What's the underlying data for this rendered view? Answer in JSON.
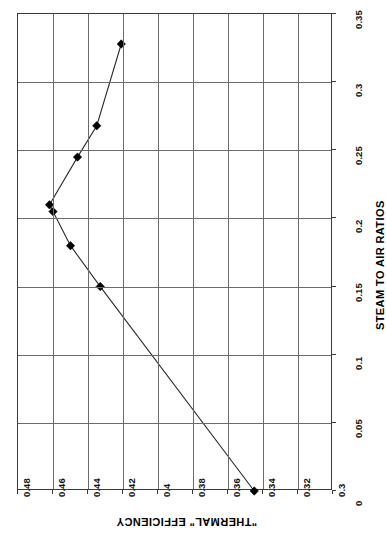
{
  "chart_data": {
    "type": "line",
    "title": "",
    "subtitle": "",
    "orientation": "rotated-90",
    "xlabel": "STEAM TO AIR RATIOS",
    "ylabel": "\"THERMAL\" EFFICIENCY",
    "xlim": [
      0,
      0.35
    ],
    "ylim": [
      0.3,
      0.48
    ],
    "xticks": [
      "0",
      "0.05",
      "0.1",
      "0.15",
      "0.2",
      "0.25",
      "0.3",
      "0.35"
    ],
    "xtick_values": [
      0,
      0.05,
      0.1,
      0.15,
      0.2,
      0.25,
      0.3,
      0.35
    ],
    "yticks": [
      "0.3",
      "0.32",
      "0.34",
      "0.36",
      "0.38",
      "0.4",
      "0.42",
      "0.44",
      "0.46",
      "0.48"
    ],
    "ytick_values": [
      0.3,
      0.32,
      0.34,
      0.36,
      0.38,
      0.4,
      0.42,
      0.44,
      0.46,
      0.48
    ],
    "grid": true,
    "legend": false,
    "legend_position": "none",
    "marker": "diamond",
    "marker_color": "#000000",
    "line_color": "#2b2b2b",
    "x": [
      0,
      0.15,
      0.18,
      0.205,
      0.21,
      0.245,
      0.268,
      0.328
    ],
    "y": [
      0.345,
      0.433,
      0.45,
      0.46,
      0.462,
      0.446,
      0.435,
      0.421
    ],
    "points": [
      {
        "x": 0,
        "y": 0.345
      },
      {
        "x": 0.15,
        "y": 0.433
      },
      {
        "x": 0.18,
        "y": 0.45
      },
      {
        "x": 0.205,
        "y": 0.46
      },
      {
        "x": 0.21,
        "y": 0.462
      },
      {
        "x": 0.245,
        "y": 0.446
      },
      {
        "x": 0.268,
        "y": 0.435
      },
      {
        "x": 0.328,
        "y": 0.421
      }
    ],
    "series": [
      {
        "name": "Thermal efficiency",
        "x": [
          0,
          0.15,
          0.18,
          0.205,
          0.21,
          0.245,
          0.268,
          0.328
        ],
        "values": [
          0.345,
          0.433,
          0.45,
          0.46,
          0.462,
          0.446,
          0.435,
          0.421
        ]
      }
    ]
  },
  "axes": {
    "efficiency": {
      "title": "\"THERMAL\" EFFICIENCY",
      "ticks": [
        "0.48",
        "0.46",
        "0.44",
        "0.42",
        "0.4",
        "0.38",
        "0.36",
        "0.34",
        "0.32",
        "0.3"
      ]
    },
    "ratio": {
      "title": "STEAM TO AIR RATIOS",
      "ticks": [
        "0.35",
        "0.3",
        "0.25",
        "0.2",
        "0.15",
        "0.1",
        "0.05",
        "0"
      ]
    }
  },
  "colors": {
    "frame": "#3a3a3a",
    "grid": "#6b6b6b",
    "line": "#2b2b2b",
    "marker": "#000000",
    "background": "#ffffff",
    "text": "#000000"
  }
}
